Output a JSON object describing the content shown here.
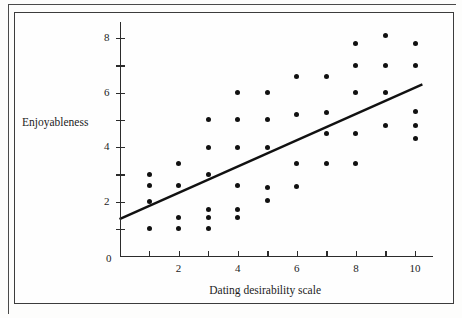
{
  "figure": {
    "top_caption": "",
    "background_color": "#fefefe",
    "frame_color": "#3c3c3c",
    "point_color": "#111111",
    "line_color": "#111111"
  },
  "chart_data": {
    "type": "scatter",
    "title": "",
    "xlabel": "Dating desirability scale",
    "ylabel": "Enjoyableness",
    "xlim": [
      0,
      10.6
    ],
    "ylim": [
      0,
      8.6
    ],
    "grid": false,
    "legend": false,
    "x_ticks": [
      0,
      1,
      2,
      3,
      4,
      5,
      6,
      7,
      8,
      9,
      10
    ],
    "x_tick_labels": [
      "0",
      "",
      "2",
      "",
      "4",
      "",
      "6",
      "",
      "8",
      "",
      "10"
    ],
    "y_ticks": [
      0,
      1,
      2,
      3,
      4,
      5,
      6,
      7,
      8
    ],
    "y_tick_labels": [
      "0",
      "",
      "2",
      "",
      "4",
      "",
      "6",
      "",
      "8"
    ],
    "points": [
      {
        "x": 1,
        "y": 3.0
      },
      {
        "x": 1,
        "y": 2.6
      },
      {
        "x": 1,
        "y": 2.0
      },
      {
        "x": 1,
        "y": 1.0
      },
      {
        "x": 2,
        "y": 3.4
      },
      {
        "x": 2,
        "y": 2.6
      },
      {
        "x": 2,
        "y": 1.4
      },
      {
        "x": 2,
        "y": 1.0
      },
      {
        "x": 3,
        "y": 5.0
      },
      {
        "x": 3,
        "y": 4.0
      },
      {
        "x": 3,
        "y": 3.0
      },
      {
        "x": 3,
        "y": 1.7
      },
      {
        "x": 3,
        "y": 1.4
      },
      {
        "x": 3,
        "y": 1.0
      },
      {
        "x": 4,
        "y": 6.0
      },
      {
        "x": 4,
        "y": 5.0
      },
      {
        "x": 4,
        "y": 4.0
      },
      {
        "x": 4,
        "y": 2.6
      },
      {
        "x": 4,
        "y": 1.7
      },
      {
        "x": 4,
        "y": 1.4
      },
      {
        "x": 5,
        "y": 6.0
      },
      {
        "x": 5,
        "y": 5.0
      },
      {
        "x": 5,
        "y": 4.0
      },
      {
        "x": 5,
        "y": 2.5
      },
      {
        "x": 5,
        "y": 2.05
      },
      {
        "x": 6,
        "y": 6.6
      },
      {
        "x": 6,
        "y": 5.2
      },
      {
        "x": 6,
        "y": 3.4
      },
      {
        "x": 6,
        "y": 2.55
      },
      {
        "x": 7,
        "y": 6.6
      },
      {
        "x": 7,
        "y": 5.25
      },
      {
        "x": 7,
        "y": 4.5
      },
      {
        "x": 7,
        "y": 3.4
      },
      {
        "x": 8,
        "y": 7.8
      },
      {
        "x": 8,
        "y": 7.0
      },
      {
        "x": 8,
        "y": 6.0
      },
      {
        "x": 8,
        "y": 4.5
      },
      {
        "x": 8,
        "y": 3.4
      },
      {
        "x": 9,
        "y": 8.1
      },
      {
        "x": 9,
        "y": 7.0
      },
      {
        "x": 9,
        "y": 6.0
      },
      {
        "x": 9,
        "y": 4.8
      },
      {
        "x": 10,
        "y": 7.8
      },
      {
        "x": 10,
        "y": 7.0
      },
      {
        "x": 10,
        "y": 5.3
      },
      {
        "x": 10,
        "y": 4.8
      },
      {
        "x": 10,
        "y": 4.3
      }
    ],
    "trend_line": {
      "label": "regression line",
      "x0": 0,
      "y0": 1.35,
      "x1": 10.25,
      "y1": 6.3
    }
  }
}
